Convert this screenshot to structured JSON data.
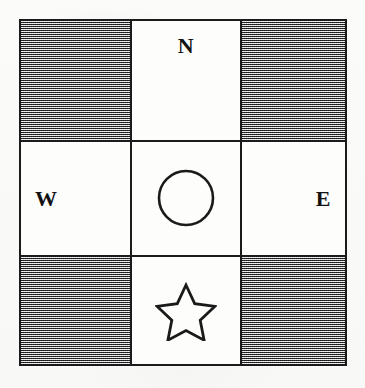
{
  "figure": {
    "name": "compass-quadrant-grid",
    "background_color": "#fbfbfa",
    "ink_color": "#1a1a1a",
    "shaded_cell_color": "#a9a9a9",
    "plain_cell_color": "#fdfdfc",
    "grid": {
      "rows": 3,
      "columns": 3,
      "cells": [
        {
          "id": "cell-top-left",
          "row": 1,
          "column": 1,
          "fill": "shaded",
          "content": ""
        },
        {
          "id": "cell-top-center",
          "row": 1,
          "column": 2,
          "fill": "plain",
          "content": "N"
        },
        {
          "id": "cell-top-right",
          "row": 1,
          "column": 3,
          "fill": "shaded",
          "content": ""
        },
        {
          "id": "cell-middle-left",
          "row": 2,
          "column": 1,
          "fill": "plain",
          "content": "W"
        },
        {
          "id": "cell-middle-center",
          "row": 2,
          "column": 2,
          "fill": "plain",
          "content": "circle"
        },
        {
          "id": "cell-middle-right",
          "row": 2,
          "column": 3,
          "fill": "plain",
          "content": "E"
        },
        {
          "id": "cell-bottom-left",
          "row": 3,
          "column": 1,
          "fill": "shaded",
          "content": ""
        },
        {
          "id": "cell-bottom-center",
          "row": 3,
          "column": 2,
          "fill": "plain",
          "content": "star"
        },
        {
          "id": "cell-bottom-right",
          "row": 3,
          "column": 3,
          "fill": "shaded",
          "content": ""
        }
      ]
    },
    "labels": {
      "north": "N",
      "west": "W",
      "east": "E"
    },
    "shapes": [
      {
        "id": "circle-shape",
        "name": "circle-icon",
        "cell": "cell-middle-center",
        "outline": true
      },
      {
        "id": "star-shape",
        "name": "star-icon",
        "cell": "cell-bottom-center",
        "points": 5,
        "outline": true
      }
    ]
  }
}
